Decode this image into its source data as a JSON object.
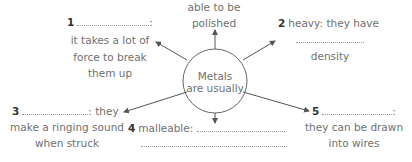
{
  "diagram": {
    "center": {
      "line1": "Metals",
      "line2": "are usually"
    },
    "top": {
      "line1": "able to be",
      "line2": "polished"
    },
    "items": [
      {
        "number": "1",
        "prefix": "",
        "suffix": ":",
        "lines": [
          "it takes a lot of",
          "force to break",
          "them up"
        ]
      },
      {
        "number": "2",
        "prefix": "heavy: they have",
        "suffix": "",
        "lines": [
          "density"
        ]
      },
      {
        "number": "3",
        "prefix": "",
        "suffix": ": they",
        "lines": [
          "make a ringing sound",
          "when struck"
        ]
      },
      {
        "number": "4",
        "prefix": "malleable:",
        "suffix": "",
        "lines": []
      },
      {
        "number": "5",
        "prefix": "",
        "suffix": ":",
        "lines": [
          "they can be drawn",
          "into wires"
        ]
      }
    ],
    "colors": {
      "line": "#555555",
      "text": "#707070",
      "number": "#333333",
      "dots": "#999999"
    }
  }
}
